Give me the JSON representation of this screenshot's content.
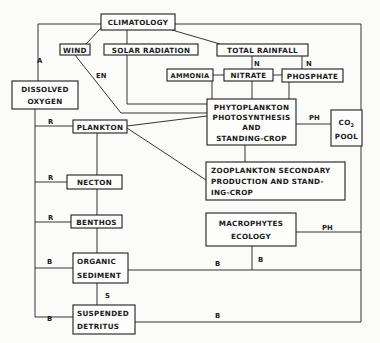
{
  "diagram": {
    "nodes": {
      "climatology": {
        "lines": [
          "CLIMATOLOGY"
        ]
      },
      "wind": {
        "lines": [
          "WIND"
        ]
      },
      "solar_radiation": {
        "lines": [
          "SOLAR RADIATION"
        ]
      },
      "total_rainfall": {
        "lines": [
          "TOTAL RAINFALL"
        ]
      },
      "ammonia": {
        "lines": [
          "AMMONIA"
        ]
      },
      "nitrate": {
        "lines": [
          "NITRATE"
        ]
      },
      "phosphate": {
        "lines": [
          "PHOSPHATE"
        ]
      },
      "dissolved_oxygen": {
        "lines": [
          "DISSOLVED",
          "OXYGEN"
        ]
      },
      "phytoplankton": {
        "lines": [
          "PHYTOPLANKTON",
          "PHOTOSYNTHESIS",
          "AND",
          "STANDING-CROP"
        ]
      },
      "co2_pool": {
        "main": "CO",
        "subscript": "2",
        "line2": "POOL"
      },
      "plankton": {
        "lines": [
          "PLANKTON"
        ]
      },
      "zooplankton": {
        "lines": [
          "ZOOPLANKTON SECONDARY",
          "PRODUCTION AND STAND-",
          "ING-CROP"
        ]
      },
      "necton": {
        "lines": [
          "NECTON"
        ]
      },
      "benthos": {
        "lines": [
          "BENTHOS"
        ]
      },
      "macrophytes": {
        "lines": [
          "MACROPHYTES",
          "ECOLOGY"
        ]
      },
      "organic_sediment": {
        "lines": [
          "ORGANIC",
          "SEDIMENT"
        ]
      },
      "suspended_detritus": {
        "lines": [
          "SUSPENDED",
          "DETRITUS"
        ]
      }
    },
    "edge_labels": {
      "climatology_to_oxygen": "A",
      "wind_to_phyto": "EN",
      "rainfall_to_nitrate": "N",
      "rainfall_to_phosphate": "N",
      "phyto_to_co2": "PH",
      "oxygen_to_plankton": "R",
      "oxygen_to_necton": "R",
      "oxygen_to_benthos": "R",
      "macrophytes_to_co2": "PH",
      "oxygen_to_sediment": "B",
      "sediment_to_right": "B",
      "macrophytes_to_sediment": "B",
      "sediment_to_detritus": "S",
      "oxygen_to_detritus": "B",
      "detritus_to_right": "B"
    }
  }
}
